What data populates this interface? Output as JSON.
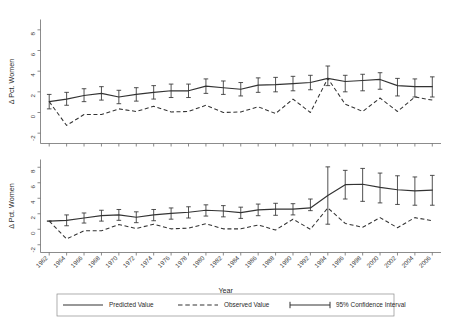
{
  "figure": {
    "title": "",
    "background_color": "#ffffff",
    "line_color": "#333333",
    "axis_color": "#6e6e6e"
  },
  "legend": {
    "position": "bottom",
    "items": [
      {
        "label": "Predicted Value",
        "style": "solid",
        "marker": "line"
      },
      {
        "label": "Observed Value",
        "style": "dashed",
        "marker": "line"
      },
      {
        "label": "95% Confidence Interval",
        "style": "errorbar",
        "marker": "capped-line"
      }
    ]
  },
  "chart_data": [
    {
      "id": "panel-top",
      "type": "line",
      "title": "",
      "xlabel": "",
      "ylabel": "Δ Pct. Women",
      "ylim": [
        -3,
        9
      ],
      "yticks": [
        -2,
        0,
        2,
        4,
        6,
        8
      ],
      "ytick_labels": [
        "-2",
        "0",
        "2",
        "4",
        "6",
        "8"
      ],
      "xlim": [
        1961,
        2007
      ],
      "xticks": [
        1962,
        1964,
        1966,
        1968,
        1970,
        1972,
        1974,
        1976,
        1978,
        1980,
        1982,
        1984,
        1986,
        1988,
        1990,
        1992,
        1994,
        1996,
        1998,
        2000,
        2002,
        2004,
        2006
      ],
      "xtick_labels_visible": false,
      "grid": false,
      "x": [
        1962,
        1964,
        1966,
        1968,
        1970,
        1972,
        1974,
        1976,
        1978,
        1980,
        1982,
        1984,
        1986,
        1988,
        1990,
        1992,
        1994,
        1996,
        1998,
        2000,
        2002,
        2004,
        2006
      ],
      "series": [
        {
          "name": "Predicted Value",
          "style": "solid",
          "values": [
            1.05,
            1.3,
            1.65,
            1.85,
            1.5,
            1.75,
            1.95,
            2.1,
            2.1,
            2.55,
            2.4,
            2.25,
            2.65,
            2.7,
            2.8,
            2.9,
            3.3,
            3.0,
            3.1,
            3.2,
            2.6,
            2.5,
            2.5
          ]
        },
        {
          "name": "Observed Value",
          "style": "dashed",
          "values": [
            1.05,
            -1.25,
            -0.2,
            -0.2,
            0.35,
            0.1,
            0.6,
            0.05,
            0.1,
            0.7,
            0.0,
            0.05,
            0.55,
            -0.1,
            1.3,
            0.0,
            3.3,
            0.8,
            0.1,
            1.4,
            0.1,
            1.5,
            1.2
          ]
        }
      ],
      "confidence_interval": {
        "name": "95% Confidence Interval",
        "level": 0.95,
        "lower": [
          0.35,
          0.7,
          1.05,
          1.2,
          0.85,
          1.1,
          1.3,
          1.45,
          1.45,
          1.85,
          1.75,
          1.6,
          1.95,
          2.0,
          2.1,
          2.2,
          2.6,
          2.0,
          2.1,
          2.25,
          1.6,
          1.5,
          1.5
        ],
        "upper": [
          1.75,
          1.95,
          2.3,
          2.5,
          2.15,
          2.4,
          2.6,
          2.75,
          2.75,
          3.25,
          3.05,
          2.9,
          3.35,
          3.4,
          3.5,
          3.6,
          4.5,
          3.6,
          3.7,
          3.85,
          3.3,
          3.25,
          3.45
        ]
      }
    },
    {
      "id": "panel-bottom",
      "type": "line",
      "title": "",
      "xlabel": "Year",
      "ylabel": "Δ Pct. Women",
      "ylim": [
        -3,
        9
      ],
      "yticks": [
        -2,
        0,
        2,
        4,
        6,
        8
      ],
      "ytick_labels": [
        "-2",
        "0",
        "2",
        "4",
        "6",
        "8"
      ],
      "xlim": [
        1961,
        2007
      ],
      "xticks": [
        1962,
        1964,
        1966,
        1968,
        1970,
        1972,
        1974,
        1976,
        1978,
        1980,
        1982,
        1984,
        1986,
        1988,
        1990,
        1992,
        1994,
        1996,
        1998,
        2000,
        2002,
        2004,
        2006
      ],
      "xtick_labels": [
        "1962",
        "1964",
        "1966",
        "1968",
        "1970",
        "1972",
        "1974",
        "1976",
        "1978",
        "1980",
        "1982",
        "1984",
        "1986",
        "1988",
        "1990",
        "1992",
        "1994",
        "1996",
        "1998",
        "2000",
        "2002",
        "2004",
        "2006"
      ],
      "xtick_labels_visible": true,
      "grid": false,
      "x": [
        1962,
        1964,
        1966,
        1968,
        1970,
        1972,
        1974,
        1976,
        1978,
        1980,
        1982,
        1984,
        1986,
        1988,
        1990,
        1992,
        1994,
        1996,
        1998,
        2000,
        2002,
        2004,
        2006
      ],
      "series": [
        {
          "name": "Predicted Value",
          "style": "solid",
          "values": [
            1.05,
            1.15,
            1.45,
            1.75,
            1.85,
            1.55,
            1.85,
            2.05,
            2.2,
            2.45,
            2.35,
            2.15,
            2.5,
            2.6,
            2.6,
            2.75,
            4.35,
            5.75,
            5.8,
            5.4,
            5.1,
            4.95,
            5.05
          ]
        },
        {
          "name": "Observed Value",
          "style": "dashed",
          "values": [
            1.05,
            -1.25,
            -0.2,
            -0.2,
            0.6,
            0.1,
            0.65,
            0.05,
            0.15,
            0.7,
            0.05,
            0.05,
            0.55,
            -0.1,
            1.3,
            0.0,
            2.75,
            0.75,
            0.25,
            1.5,
            0.2,
            1.5,
            1.1
          ]
        }
      ],
      "confidence_interval": {
        "name": "95% Confidence Interval",
        "level": 0.95,
        "lower": [
          1.05,
          0.45,
          0.8,
          1.05,
          1.15,
          0.85,
          1.1,
          1.3,
          1.45,
          1.7,
          1.6,
          1.4,
          1.75,
          1.8,
          1.85,
          2.4,
          0.65,
          3.9,
          3.6,
          3.4,
          3.2,
          3.1,
          3.1
        ],
        "upper": [
          1.05,
          1.85,
          2.1,
          2.45,
          2.55,
          2.25,
          2.55,
          2.75,
          2.9,
          3.15,
          3.05,
          2.85,
          3.25,
          3.35,
          3.3,
          3.9,
          8.05,
          7.6,
          7.85,
          7.25,
          6.9,
          6.75,
          6.95
        ]
      }
    }
  ]
}
